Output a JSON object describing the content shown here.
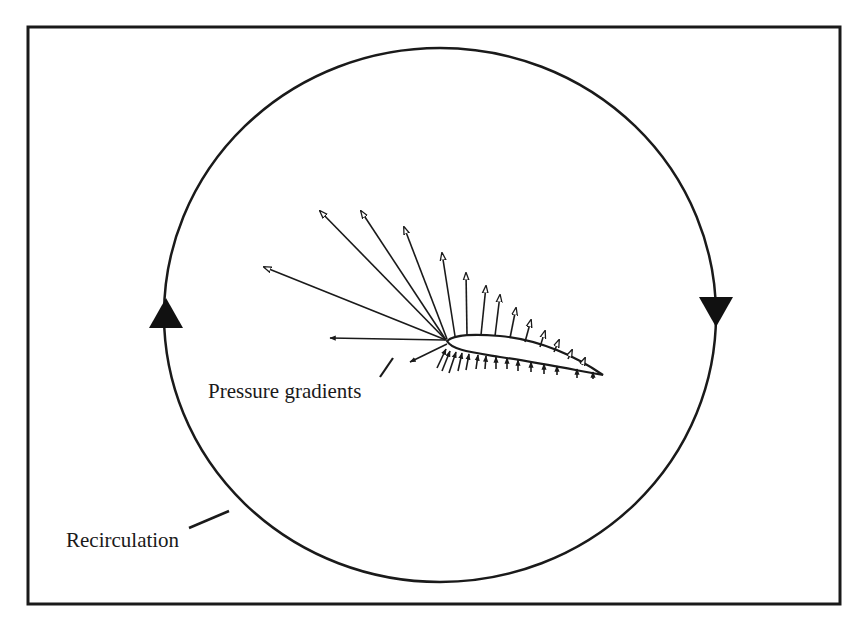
{
  "figure": {
    "labels": {
      "pressure": "Pressure gradients",
      "recirculation": "Recirculation"
    },
    "colors": {
      "ink": "#1a1a1a",
      "background": "#ffffff"
    },
    "frame": {
      "x": 28,
      "y": 27,
      "width": 812,
      "height": 577
    },
    "circle": {
      "cx": 440,
      "cy": 315,
      "rx": 276,
      "ry": 267
    },
    "flow_direction": "clockwise",
    "arrowheads": [
      {
        "position": "left",
        "direction": "up"
      },
      {
        "position": "right",
        "direction": "down"
      }
    ],
    "airfoil": {
      "leading_edge": [
        447,
        340
      ],
      "trailing_edge": [
        603,
        375
      ]
    }
  }
}
